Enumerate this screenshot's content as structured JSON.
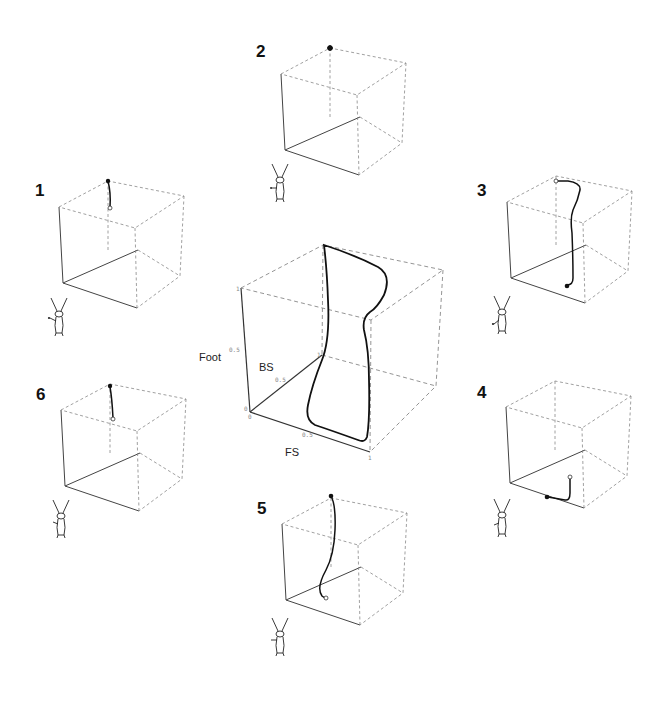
{
  "figure": {
    "main_plot": {
      "axes": {
        "vertical": {
          "label": "Foot",
          "ticks": [
            "0",
            "0.5",
            "1"
          ]
        },
        "depth": {
          "label": "BS",
          "ticks": [
            "0",
            "0.5",
            "1"
          ]
        },
        "horizontal": {
          "label": "FS",
          "ticks": [
            "0.5",
            "1"
          ]
        }
      },
      "description": "Closed-loop trajectory in 3D cube (Foot vs BS vs FS)"
    },
    "panels": [
      {
        "id": "1",
        "label": "1",
        "marker_start": "filled",
        "marker_end": "open"
      },
      {
        "id": "2",
        "label": "2",
        "marker_start": "filled",
        "marker_end": "filled"
      },
      {
        "id": "3",
        "label": "3",
        "marker_start": "open",
        "marker_end": "filled"
      },
      {
        "id": "4",
        "label": "4",
        "marker_start": "open",
        "marker_end": "filled"
      },
      {
        "id": "5",
        "label": "5",
        "marker_start": "filled",
        "marker_end": "open"
      },
      {
        "id": "6",
        "label": "6",
        "marker_start": "filled",
        "marker_end": "open"
      }
    ]
  }
}
